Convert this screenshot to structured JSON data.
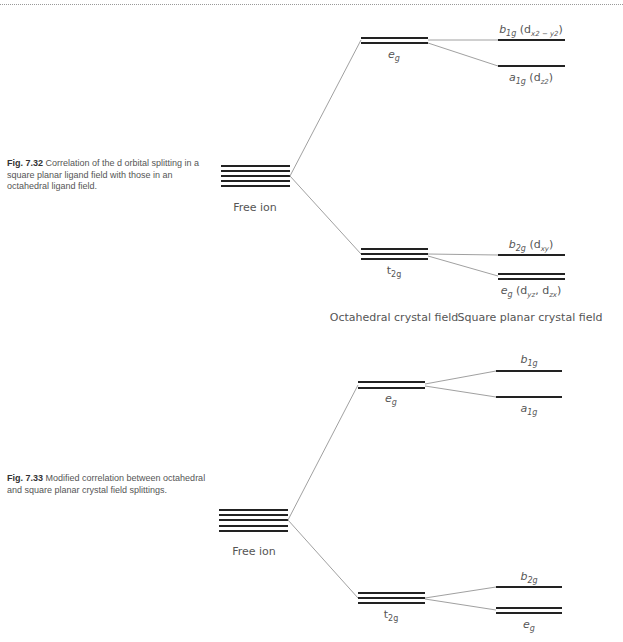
{
  "fig32": {
    "caption_label": "Fig. 7.32",
    "caption_text": "Correlation of the d orbital splitting in a square planar ligand field with those in an octahedral ligand field.",
    "free_ion": "Free ion",
    "oct_upper": "eg",
    "oct_lower": "t2g",
    "sq_b1g": "b1g (dx2 − y2)",
    "sq_a1g": "a1g (dz2)",
    "sq_b2g": "b2g (dxy)",
    "sq_eg": "eg (dyz, dzx)",
    "axis_oct": "Octahedral crystal field",
    "axis_sq": "Square planar crystal field"
  },
  "fig33": {
    "caption_label": "Fig. 7.33",
    "caption_text": "Modified correlation between octahedral and square planar crystal field splittings.",
    "free_ion": "Free ion",
    "oct_upper": "eg",
    "oct_lower": "t2g",
    "sq_b1g": "b1g",
    "sq_a1g": "a1g",
    "sq_b2g": "b2g",
    "sq_eg": "eg"
  }
}
